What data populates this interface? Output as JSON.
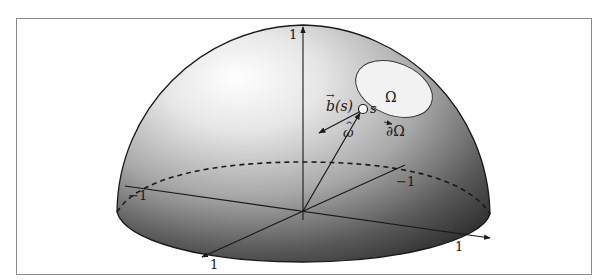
{
  "figure": {
    "type": "hemisphere-diagram",
    "colors": {
      "frame": "#8a8a8a",
      "outline": "#1a1a1a",
      "highlight": "#ffffff",
      "shadow": "#2a2a2a",
      "region_fill": "#f2f2f2"
    },
    "axes": {
      "vertical_tick": "1",
      "left_tick": "−1",
      "back_tick": "−1",
      "front_tick": "1",
      "right_tick": "1"
    },
    "region": {
      "label": "Ω",
      "boundary_label": "∂Ω"
    },
    "point": {
      "label": "s"
    },
    "vectors": {
      "b_label": "b(s)",
      "b_arrow_glyph": "→",
      "omega_label": "ω",
      "omega_hat_glyph": "^"
    }
  }
}
